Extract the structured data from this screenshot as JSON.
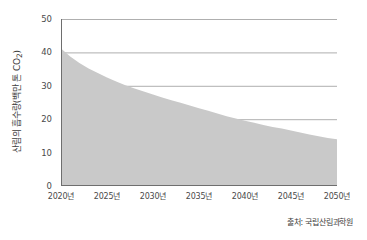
{
  "chart_data": {
    "type": "area",
    "title": "",
    "xlabel": "",
    "ylabel": "산림의 흡수량(백만 톤 CO2)",
    "ylabel_base": "산림의 흡수량(백만 톤 CO",
    "ylabel_sub": "2",
    "ylabel_tail": ")",
    "x": [
      2020,
      2021,
      2022,
      2023,
      2024,
      2025,
      2026,
      2027,
      2028,
      2029,
      2030,
      2031,
      2032,
      2033,
      2034,
      2035,
      2036,
      2037,
      2038,
      2039,
      2040,
      2041,
      2042,
      2043,
      2044,
      2045,
      2046,
      2047,
      2048,
      2049,
      2050
    ],
    "values": [
      41.2,
      38.8,
      36.8,
      35.2,
      33.8,
      32.5,
      31.3,
      30.2,
      29.2,
      28.3,
      27.4,
      26.5,
      25.7,
      24.9,
      24.1,
      23.3,
      22.5,
      21.7,
      20.9,
      20.2,
      19.5,
      18.9,
      18.3,
      17.7,
      17.2,
      16.6,
      16.0,
      15.4,
      14.9,
      14.4,
      14.0
    ],
    "series": [
      {
        "name": "산림의 흡수량",
        "values": [
          41.2,
          38.8,
          36.8,
          35.2,
          33.8,
          32.5,
          31.3,
          30.2,
          29.2,
          28.3,
          27.4,
          26.5,
          25.7,
          24.9,
          24.1,
          23.3,
          22.5,
          21.7,
          20.9,
          20.2,
          19.5,
          18.9,
          18.3,
          17.7,
          17.2,
          16.6,
          16.0,
          15.4,
          14.9,
          14.4,
          14.0
        ]
      }
    ],
    "xlim": [
      2020,
      2050
    ],
    "ylim": [
      0,
      50
    ],
    "y_ticks": [
      0,
      10,
      20,
      30,
      40,
      50
    ],
    "y_tick_labels": [
      "0",
      "10",
      "20",
      "30",
      "40",
      "50"
    ],
    "x_ticks": [
      2020,
      2025,
      2030,
      2035,
      2040,
      2045,
      2050
    ],
    "x_tick_labels": [
      "2020년",
      "2025년",
      "2030년",
      "2035년",
      "2040년",
      "2045년",
      "2050년"
    ],
    "grid": true,
    "legend": "none",
    "colors": {
      "area_fill": "#c9c9c9",
      "grid_line": "#9a9a9a",
      "axis_line": "#6e6e6e",
      "text": "#4a4a4a",
      "background": "#ffffff"
    }
  },
  "source": {
    "label": "출처: 국립산림과학원"
  }
}
